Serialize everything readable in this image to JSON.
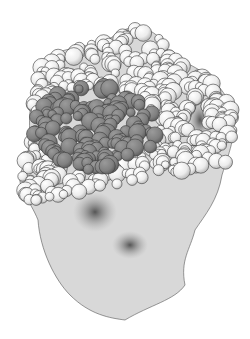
{
  "figure": {
    "colors": {
      "background": "#ffffff",
      "light_atom": "#f2f2f2",
      "light_atom_shade": "#c8c8c8",
      "dark_atom": "#8a8a8a",
      "dark_atom_shade": "#5e5e5e",
      "outline": "#3a3a3a",
      "cavity": "#6a6a6a"
    },
    "dark_region": {
      "cx": 95,
      "cy": 128,
      "rx": 62,
      "ry": 42
    },
    "cavities": [
      {
        "cx": 95,
        "cy": 212,
        "rx": 22,
        "ry": 20
      },
      {
        "cx": 130,
        "cy": 245,
        "rx": 18,
        "ry": 14
      },
      {
        "cx": 200,
        "cy": 120,
        "rx": 12,
        "ry": 20
      }
    ],
    "outline_shape": "M45,60 C60,45 100,48 115,35 C135,20 160,28 170,55 C190,65 220,75 232,110 C238,130 230,150 222,175 C218,200 205,215 195,230 C190,250 180,260 185,285 C175,300 150,305 125,320 C110,318 90,315 70,295 C55,280 40,250 38,220 C30,200 18,190 20,175 C25,160 30,150 30,135 C28,110 32,85 45,60 Z"
  }
}
